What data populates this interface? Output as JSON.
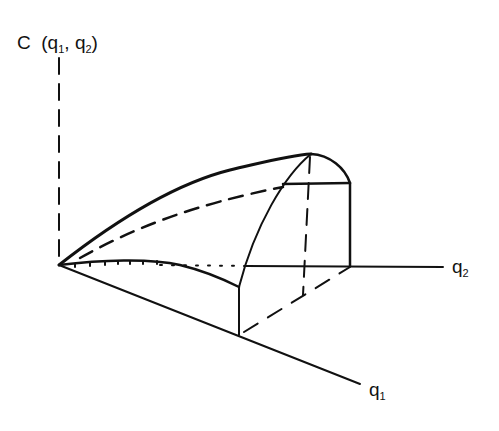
{
  "diagram": {
    "axes": {
      "vertical": {
        "label_main": "C",
        "label_open": "(q",
        "sub1": "1",
        "comma": ", q",
        "sub2": "2",
        "label_close": ")"
      },
      "q2": {
        "label": "q",
        "sub": "2"
      },
      "q1": {
        "label": "q",
        "sub": "1"
      }
    },
    "colors": {
      "stroke": "#111111",
      "background": "#ffffff"
    }
  }
}
